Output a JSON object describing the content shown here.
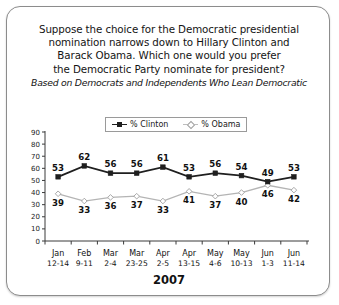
{
  "card": {
    "title_lines": [
      "Suppose the choice for the Democratic presidential",
      "nomination narrows down to Hillary Clinton and",
      "Barack Obama. Which one would you prefer",
      "the Democratic Party nominate for president?"
    ],
    "subtitle": "Based on Democrats and Independents Who Lean Democratic",
    "year_label": "2007"
  },
  "legend": {
    "entries": [
      {
        "label": "% Clinton",
        "color": "#1f1f1f",
        "marker": "square"
      },
      {
        "label": "% Obama",
        "color": "#b4b4b4",
        "marker": "diamond"
      }
    ]
  },
  "chart_data": {
    "type": "line",
    "title": "Suppose the choice for the Democratic presidential nomination narrows down to Hillary Clinton and Barack Obama. Which one would you prefer the Democratic Party nominate for president?",
    "subtitle": "Based on Democrats and Independents Who Lean Democratic",
    "xlabel": "2007",
    "ylabel": "",
    "ylim": [
      0,
      90
    ],
    "yticks": [
      0,
      10,
      20,
      30,
      40,
      50,
      60,
      70,
      80,
      90
    ],
    "ytick_labels": [
      "0",
      "10",
      "20",
      "30",
      "40",
      "50",
      "60",
      "70",
      "80",
      "90"
    ],
    "grid": false,
    "legend_position": "top-center",
    "categories": [
      "Jan\n12-14",
      "Feb\n9-11",
      "Mar\n2-4",
      "Mar\n23-25",
      "Apr\n2-5",
      "Apr\n13-15",
      "May\n4-6",
      "May\n10-13",
      "Jun\n1-3",
      "Jun\n11-14"
    ],
    "category_months": [
      "Jan",
      "Feb",
      "Mar",
      "Mar",
      "Apr",
      "Apr",
      "May",
      "May",
      "Jun",
      "Jun"
    ],
    "category_days": [
      "12-14",
      "9-11",
      "2-4",
      "23-25",
      "2-5",
      "13-15",
      "4-6",
      "10-13",
      "1-3",
      "11-14"
    ],
    "series": [
      {
        "name": "% Clinton",
        "color": "#1f1f1f",
        "marker": "square",
        "values": [
          53,
          62,
          56,
          56,
          61,
          53,
          56,
          54,
          49,
          53
        ],
        "label_positions": [
          "above",
          "above",
          "above",
          "above",
          "above",
          "above",
          "above",
          "above",
          "above",
          "above"
        ]
      },
      {
        "name": "% Obama",
        "color": "#b4b4b4",
        "marker": "diamond",
        "values": [
          39,
          33,
          36,
          37,
          33,
          41,
          37,
          40,
          46,
          42
        ],
        "label_positions": [
          "below",
          "below",
          "below",
          "below",
          "below",
          "below",
          "below",
          "below",
          "below",
          "below"
        ]
      }
    ]
  }
}
